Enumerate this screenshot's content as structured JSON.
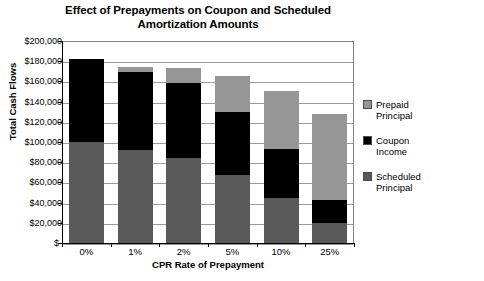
{
  "chart_data": {
    "type": "bar",
    "stacked": true,
    "title": "Effect of Prepayments on Coupon and Scheduled Amortization Amounts",
    "title_line1": "Effect of Prepayments on Coupon and Scheduled",
    "title_line2": "Amortization Amounts",
    "xlabel": "CPR Rate of Prepayment",
    "ylabel": "Total Cash Flows",
    "categories": [
      "0%",
      "1%",
      "2%",
      "5%",
      "10%",
      "25%"
    ],
    "series": [
      {
        "name": "Scheduled Principal",
        "color": "#595959",
        "values": [
          100000,
          92000,
          84000,
          67000,
          45000,
          20000
        ]
      },
      {
        "name": "Coupon Income",
        "color": "#000000",
        "values": [
          82000,
          77000,
          74000,
          63000,
          48000,
          23000
        ]
      },
      {
        "name": "Prepaid Principal",
        "color": "#969696",
        "values": [
          0,
          5000,
          15000,
          35000,
          58000,
          85000
        ]
      }
    ],
    "totals": [
      182000,
      174000,
      173000,
      165000,
      151000,
      128000
    ],
    "ylim": [
      0,
      200000
    ],
    "ytick_values": [
      200000,
      180000,
      160000,
      140000,
      120000,
      100000,
      80000,
      60000,
      40000,
      20000,
      0
    ],
    "ytick_labels": [
      "$200,000",
      "$180,000",
      "$160,000",
      "$140,000",
      "$120,000",
      "$100,000",
      "$80,000",
      "$60,000",
      "$40,000",
      "$20,000",
      "$-"
    ],
    "grid": true,
    "legend_position": "right",
    "legend": [
      {
        "label": "Prepaid\nPrincipal",
        "color": "#969696"
      },
      {
        "label": "Coupon\nIncome",
        "color": "#000000"
      },
      {
        "label": "Scheduled\nPrincipal",
        "color": "#595959"
      }
    ]
  }
}
